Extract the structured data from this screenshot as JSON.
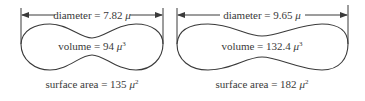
{
  "colors": {
    "stroke": "#3a3a3a",
    "text": "#3a3a3a",
    "background": "#ffffff"
  },
  "cells": [
    {
      "diameter_label": "diameter = 7.82 ",
      "diameter_unit": "μ",
      "volume_label": "volume = 94 ",
      "volume_unit": "μ",
      "volume_exp": "3",
      "surface_label": "surface area = 135 ",
      "surface_unit": "μ",
      "surface_exp": "2"
    },
    {
      "diameter_label": "diameter = 9.65 ",
      "diameter_unit": "μ",
      "volume_label": "volume = 132.4 ",
      "volume_unit": "μ",
      "volume_exp": "3",
      "surface_label": "surface area = 182 ",
      "surface_unit": "μ",
      "surface_exp": "2"
    }
  ]
}
